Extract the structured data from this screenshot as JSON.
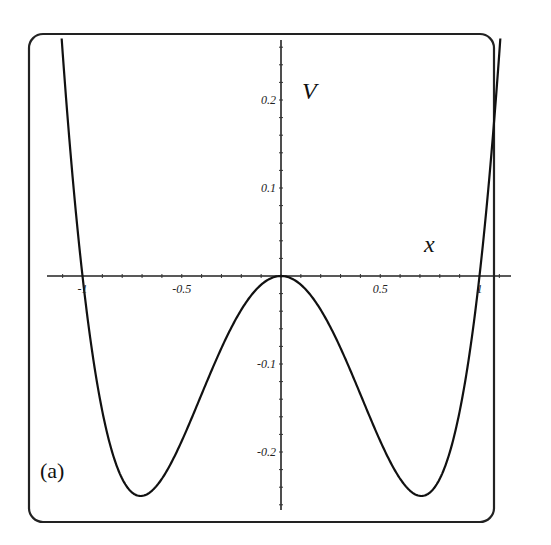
{
  "chart_data": {
    "type": "line",
    "title": "",
    "panel_label": "(a)",
    "xlabel": "x",
    "ylabel": "V",
    "function": "V = x^4 - x^2",
    "xlim": [
      -1.12,
      1.12
    ],
    "ylim": [
      -0.27,
      0.26
    ],
    "grid": false,
    "legend": null,
    "x_ticks": [
      {
        "value": -1,
        "label": "-1"
      },
      {
        "value": -0.5,
        "label": "-0.5"
      },
      {
        "value": 0.5,
        "label": "0.5"
      },
      {
        "value": 1,
        "label": "1"
      }
    ],
    "y_ticks": [
      {
        "value": 0.2,
        "label": "0.2"
      },
      {
        "value": 0.1,
        "label": "0.1"
      },
      {
        "value": -0.1,
        "label": "-0.1"
      },
      {
        "value": -0.2,
        "label": "-0.2"
      }
    ],
    "series": [
      {
        "name": "V(x)",
        "x": [
          -1.1,
          -1.0,
          -0.9,
          -0.8,
          -0.707,
          -0.6,
          -0.5,
          -0.4,
          -0.3,
          -0.2,
          -0.1,
          0,
          0.1,
          0.2,
          0.3,
          0.4,
          0.5,
          0.6,
          0.707,
          0.8,
          0.9,
          1.0,
          1.1
        ],
        "y": [
          0.254,
          0.0,
          -0.154,
          -0.23,
          -0.25,
          -0.23,
          -0.1875,
          -0.134,
          -0.0819,
          -0.0384,
          -0.0099,
          0,
          -0.0099,
          -0.0384,
          -0.0819,
          -0.134,
          -0.1875,
          -0.23,
          -0.25,
          -0.23,
          -0.154,
          0.0,
          0.254
        ]
      }
    ],
    "key_points": {
      "maximum": {
        "x": 0,
        "y": 0
      },
      "minima": [
        {
          "x": -0.707,
          "y": -0.25
        },
        {
          "x": 0.707,
          "y": -0.25
        }
      ],
      "zeros": [
        -1,
        0,
        1
      ]
    }
  }
}
